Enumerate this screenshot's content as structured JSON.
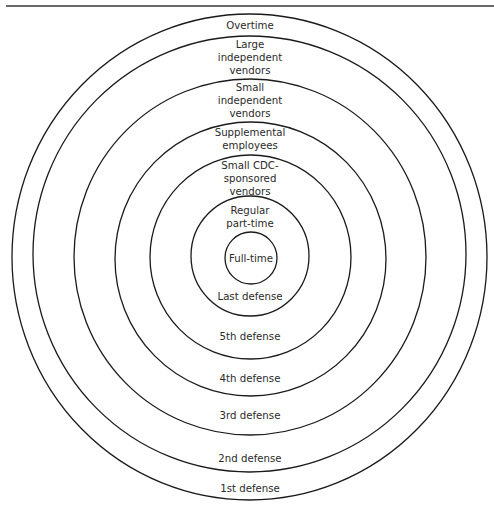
{
  "diagram": {
    "type": "concentric-circles",
    "rings": [
      {
        "id": "ring-1",
        "cx": 249.5,
        "cy": 257,
        "rx": 237.5,
        "ry": 243
      },
      {
        "id": "ring-2",
        "cx": 249.5,
        "cy": 254,
        "rx": 216.5,
        "ry": 218
      },
      {
        "id": "ring-3",
        "cx": 250,
        "cy": 257,
        "rx": 176,
        "ry": 178
      },
      {
        "id": "ring-4",
        "cx": 250.5,
        "cy": 259,
        "rx": 135.5,
        "ry": 137
      },
      {
        "id": "ring-5",
        "cx": 250.5,
        "cy": 257,
        "rx": 100.5,
        "ry": 102
      },
      {
        "id": "ring-6",
        "cx": 250,
        "cy": 256,
        "rx": 59,
        "ry": 60
      },
      {
        "id": "ring-7",
        "cx": 251,
        "cy": 258,
        "rx": 26,
        "ry": 26
      }
    ],
    "upper_labels": [
      {
        "lines": [
          "Overtime"
        ],
        "x": 250,
        "y": 25
      },
      {
        "lines": [
          "Large",
          "independent",
          "vendors"
        ],
        "x": 250,
        "y": 57
      },
      {
        "lines": [
          "Small",
          "independent",
          "vendors"
        ],
        "x": 250,
        "y": 100
      },
      {
        "lines": [
          "Supplemental",
          "employees"
        ],
        "x": 250,
        "y": 139
      },
      {
        "lines": [
          "Small CDC-",
          "sponsored",
          "vendors"
        ],
        "x": 250,
        "y": 178
      },
      {
        "lines": [
          "Regular",
          "part-time"
        ],
        "x": 250,
        "y": 217
      },
      {
        "lines": [
          "Full-time"
        ],
        "x": 251,
        "y": 258
      }
    ],
    "lower_labels": [
      {
        "text": "Last defense",
        "x": 250,
        "y": 296
      },
      {
        "text": "5th defense",
        "x": 250,
        "y": 336
      },
      {
        "text": "4th defense",
        "x": 250,
        "y": 378
      },
      {
        "text": "3rd defense",
        "x": 250,
        "y": 415
      },
      {
        "text": "2nd defense",
        "x": 250,
        "y": 458
      },
      {
        "text": "1st defense",
        "x": 250,
        "y": 488
      }
    ],
    "stroke_color": "#1a1a1a",
    "rule_color": "#6a6a6a"
  }
}
